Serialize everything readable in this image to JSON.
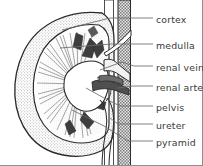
{
  "figure": {
    "type": "anatomical-line-diagram",
    "width": 203,
    "height": 166,
    "background_color": "#ffffff",
    "ink_color": "#2b2b2b",
    "label_color": "#3a3a3a",
    "border": {
      "right": true,
      "bottom": true,
      "color": "#8f8f8f"
    }
  },
  "labels": [
    {
      "id": "cortex",
      "text": "cortex",
      "x": 156,
      "y": 15
    },
    {
      "id": "medulla",
      "text": "medulla",
      "x": 156,
      "y": 41
    },
    {
      "id": "renal-vein",
      "text": "renal vein",
      "x": 156,
      "y": 63
    },
    {
      "id": "renal-artery",
      "text": "renal artery",
      "x": 156,
      "y": 83
    },
    {
      "id": "pelvis",
      "text": "pelvis",
      "x": 156,
      "y": 103
    },
    {
      "id": "ureter",
      "text": "ureter",
      "x": 156,
      "y": 121
    },
    {
      "id": "pyramid",
      "text": "pyramid",
      "x": 156,
      "y": 138
    }
  ],
  "structures": [
    {
      "id": "renal-capsule",
      "name": "renal capsule outline"
    },
    {
      "id": "cortex-band",
      "name": "cortex (stippled outer band)"
    },
    {
      "id": "medulla-region",
      "name": "medulla with renal pyramids"
    },
    {
      "id": "renal-pelvis",
      "name": "renal pelvis (white funnel)"
    },
    {
      "id": "renal-vein",
      "name": "renal vein (pale vessel)"
    },
    {
      "id": "renal-artery",
      "name": "renal artery (dark wedge)"
    },
    {
      "id": "ureter-tube",
      "name": "ureter (descending tube)"
    },
    {
      "id": "great-vessel",
      "name": "aorta / vena cava (hatched vertical vessel)"
    }
  ]
}
